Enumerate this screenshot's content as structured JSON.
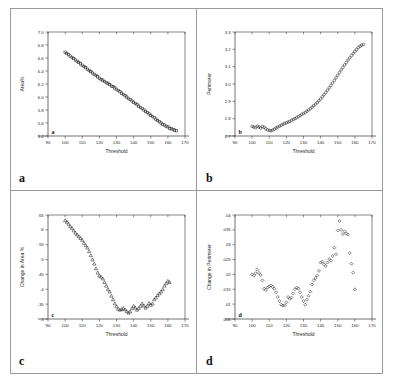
{
  "figure": {
    "panel_letters": [
      "a",
      "b",
      "c",
      "d"
    ]
  },
  "chart_data": [
    {
      "id": "a",
      "type": "scatter",
      "title": "",
      "xlabel": "Threshold",
      "ylabel": "Area%",
      "panel_label": "a",
      "marker": "open-square",
      "xlim": [
        90,
        170
      ],
      "ylim": [
        5.4,
        7.0
      ],
      "xticks": [
        90,
        100,
        110,
        120,
        130,
        140,
        150,
        160,
        170
      ],
      "xticklabels": [
        "90",
        "100",
        "110",
        "120",
        "130",
        "140",
        "150",
        "160",
        "170"
      ],
      "yticks": [
        5.4,
        5.6,
        5.8,
        6.0,
        6.2,
        6.4,
        6.6,
        6.8,
        7.0
      ],
      "yticklabels": [
        "5.4",
        "5.6",
        "5.8",
        "6.0",
        "6.2",
        "6.4",
        "6.6",
        "6.8",
        "7.0"
      ],
      "grid": false,
      "legend": "none",
      "x": [
        100,
        101,
        102,
        103,
        104,
        105,
        106,
        107,
        108,
        109,
        110,
        111,
        112,
        113,
        114,
        115,
        116,
        117,
        118,
        119,
        120,
        121,
        122,
        123,
        124,
        125,
        126,
        127,
        128,
        129,
        130,
        131,
        132,
        133,
        134,
        135,
        136,
        137,
        138,
        139,
        140,
        141,
        142,
        143,
        144,
        145,
        146,
        147,
        148,
        149,
        150,
        151,
        152,
        153,
        154,
        155,
        156,
        157,
        158,
        159,
        160,
        161,
        162,
        163,
        164,
        165
      ],
      "y": [
        6.69,
        6.67,
        6.65,
        6.63,
        6.61,
        6.59,
        6.57,
        6.55,
        6.53,
        6.51,
        6.49,
        6.47,
        6.45,
        6.43,
        6.41,
        6.39,
        6.37,
        6.35,
        6.33,
        6.31,
        6.29,
        6.27,
        6.26,
        6.24,
        6.22,
        6.21,
        6.19,
        6.17,
        6.16,
        6.14,
        6.12,
        6.1,
        6.08,
        6.06,
        6.04,
        6.02,
        6.0,
        5.98,
        5.96,
        5.94,
        5.92,
        5.9,
        5.88,
        5.86,
        5.84,
        5.82,
        5.8,
        5.78,
        5.76,
        5.74,
        5.72,
        5.7,
        5.68,
        5.66,
        5.64,
        5.62,
        5.6,
        5.58,
        5.57,
        5.55,
        5.54,
        5.52,
        5.51,
        5.5,
        5.49,
        5.48
      ]
    },
    {
      "id": "b",
      "type": "scatter",
      "title": "",
      "xlabel": "Threshold",
      "ylabel": "Perimeter",
      "panel_label": "b",
      "marker": "open-circle",
      "xlim": [
        90,
        170
      ],
      "ylim": [
        2.7,
        3.3
      ],
      "xticks": [
        90,
        100,
        110,
        120,
        130,
        140,
        150,
        160,
        170
      ],
      "xticklabels": [
        "90",
        "100",
        "110",
        "120",
        "130",
        "140",
        "150",
        "160",
        "170"
      ],
      "yticks": [
        2.7,
        2.8,
        2.9,
        3.0,
        3.1,
        3.2,
        3.3
      ],
      "yticklabels": [
        "2.7",
        "2.8",
        "2.9",
        "3.0",
        "3.1",
        "3.2",
        "3.3"
      ],
      "grid": false,
      "legend": "none",
      "x": [
        100,
        101,
        102,
        103,
        104,
        105,
        106,
        107,
        108,
        109,
        110,
        111,
        112,
        113,
        114,
        115,
        116,
        117,
        118,
        119,
        120,
        121,
        122,
        123,
        124,
        125,
        126,
        127,
        128,
        129,
        130,
        131,
        132,
        133,
        134,
        135,
        136,
        137,
        138,
        139,
        140,
        141,
        142,
        143,
        144,
        145,
        146,
        147,
        148,
        149,
        150,
        151,
        152,
        153,
        154,
        155,
        156,
        157,
        158,
        159,
        160,
        161,
        162,
        163,
        164,
        165
      ],
      "y": [
        2.755,
        2.752,
        2.748,
        2.757,
        2.752,
        2.746,
        2.755,
        2.75,
        2.742,
        2.736,
        2.732,
        2.73,
        2.734,
        2.74,
        2.746,
        2.752,
        2.757,
        2.762,
        2.768,
        2.772,
        2.776,
        2.78,
        2.784,
        2.79,
        2.796,
        2.8,
        2.806,
        2.812,
        2.818,
        2.824,
        2.83,
        2.836,
        2.843,
        2.85,
        2.858,
        2.866,
        2.875,
        2.884,
        2.893,
        2.903,
        2.914,
        2.926,
        2.938,
        2.951,
        2.964,
        2.978,
        2.992,
        3.006,
        3.021,
        3.036,
        3.051,
        3.066,
        3.081,
        3.096,
        3.11,
        3.124,
        3.138,
        3.151,
        3.164,
        3.176,
        3.188,
        3.199,
        3.21,
        3.218,
        3.224,
        3.228
      ]
    },
    {
      "id": "c",
      "type": "scatter",
      "title": "",
      "xlabel": "Threshold",
      "ylabel": "Change in Area %",
      "panel_label": "c",
      "marker": "open-triangle",
      "xlim": [
        90,
        170
      ],
      "ylim": [
        0.3,
        0.65
      ],
      "xticks": [
        90,
        100,
        110,
        120,
        130,
        140,
        150,
        160,
        170
      ],
      "xticklabels": [
        "90",
        "100",
        "110",
        "120",
        "130",
        "140",
        "150",
        "160",
        "170"
      ],
      "yticks": [
        0.3,
        0.35,
        0.4,
        0.45,
        0.5,
        0.55,
        0.6,
        0.65
      ],
      "yticklabels": [
        ".3",
        ".35",
        ".4",
        ".45",
        ".5",
        ".55",
        ".6",
        ".65"
      ],
      "grid": false,
      "legend": "none",
      "x": [
        100,
        101,
        102,
        103,
        104,
        105,
        106,
        107,
        108,
        109,
        110,
        111,
        112,
        113,
        114,
        115,
        116,
        117,
        118,
        119,
        120,
        121,
        122,
        123,
        124,
        125,
        126,
        127,
        128,
        129,
        130,
        131,
        132,
        133,
        134,
        135,
        136,
        137,
        138,
        139,
        140,
        141,
        142,
        143,
        144,
        145,
        146,
        147,
        148,
        149,
        150,
        151,
        152,
        153,
        154,
        155,
        156,
        157,
        158,
        159,
        160,
        161
      ],
      "y": [
        0.632,
        0.627,
        0.62,
        0.612,
        0.606,
        0.598,
        0.59,
        0.584,
        0.578,
        0.572,
        0.566,
        0.556,
        0.548,
        0.54,
        0.528,
        0.514,
        0.5,
        0.486,
        0.47,
        0.456,
        0.446,
        0.442,
        0.436,
        0.424,
        0.412,
        0.4,
        0.392,
        0.378,
        0.366,
        0.352,
        0.342,
        0.334,
        0.331,
        0.333,
        0.336,
        0.332,
        0.326,
        0.321,
        0.325,
        0.336,
        0.344,
        0.338,
        0.331,
        0.336,
        0.344,
        0.352,
        0.345,
        0.338,
        0.344,
        0.353,
        0.348,
        0.352,
        0.366,
        0.372,
        0.38,
        0.386,
        0.392,
        0.4,
        0.412,
        0.42,
        0.428,
        0.424
      ]
    },
    {
      "id": "d",
      "type": "scatter",
      "title": "",
      "xlabel": "Threshold",
      "ylabel": "Change in Perimeter",
      "panel_label": "d",
      "marker": "open-diamond",
      "xlim": [
        90,
        170
      ],
      "ylim": [
        0.005,
        0.04
      ],
      "xticks": [
        90,
        100,
        110,
        120,
        130,
        140,
        150,
        160,
        170
      ],
      "xticklabels": [
        "90",
        "100",
        "110",
        "120",
        "130",
        "140",
        "150",
        "160",
        "170"
      ],
      "yticks": [
        0.005,
        0.01,
        0.015,
        0.02,
        0.025,
        0.03,
        0.035,
        0.04
      ],
      "yticklabels": [
        ".005",
        ".01",
        ".015",
        ".02",
        ".025",
        ".03",
        ".035",
        ".04"
      ],
      "grid": false,
      "legend": "none",
      "x": [
        100,
        101,
        102,
        103,
        104,
        105,
        106,
        107,
        108,
        109,
        110,
        111,
        112,
        113,
        114,
        115,
        116,
        117,
        118,
        119,
        120,
        121,
        122,
        123,
        124,
        125,
        126,
        127,
        128,
        129,
        130,
        131,
        132,
        133,
        134,
        135,
        136,
        137,
        138,
        139,
        140,
        141,
        142,
        143,
        144,
        145,
        146,
        147,
        148,
        149,
        150,
        151,
        152,
        153,
        154,
        155,
        156,
        157,
        158,
        159,
        160
      ],
      "y": [
        0.02,
        0.0196,
        0.0204,
        0.0216,
        0.0205,
        0.0198,
        0.018,
        0.0152,
        0.0148,
        0.0156,
        0.016,
        0.0163,
        0.0158,
        0.0152,
        0.014,
        0.0124,
        0.011,
        0.0098,
        0.0095,
        0.0096,
        0.0106,
        0.0124,
        0.0118,
        0.0122,
        0.0136,
        0.015,
        0.0156,
        0.0152,
        0.014,
        0.0124,
        0.011,
        0.0098,
        0.0115,
        0.0128,
        0.0142,
        0.0166,
        0.018,
        0.0188,
        0.0196,
        0.0212,
        0.024,
        0.0243,
        0.0234,
        0.0228,
        0.024,
        0.0252,
        0.0246,
        0.0262,
        0.029,
        0.0268,
        0.0348,
        0.038,
        0.035,
        0.0336,
        0.0345,
        0.0338,
        0.0334,
        0.0272,
        0.0236,
        0.0206,
        0.015
      ]
    }
  ]
}
